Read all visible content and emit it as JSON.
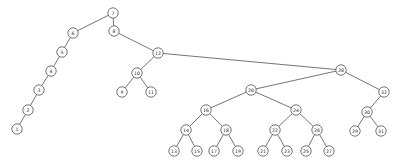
{
  "diagram": {
    "kind": "binary-search-tree",
    "title": "",
    "node_radius": 5.2,
    "colors": {
      "background": "#ffffff",
      "edge": "#3a3a3a",
      "node_fill": "#ffffff",
      "node_stroke": "#3a3a3a",
      "label": "#1a1a1a"
    },
    "root_label": "7",
    "nodes": [
      {
        "id": "n7",
        "label": "7",
        "x": 113,
        "y": 13
      },
      {
        "id": "n6",
        "label": "6",
        "x": 73,
        "y": 33
      },
      {
        "id": "n5",
        "label": "5",
        "x": 62,
        "y": 52
      },
      {
        "id": "n4",
        "label": "4",
        "x": 51,
        "y": 71
      },
      {
        "id": "n3",
        "label": "3",
        "x": 39,
        "y": 90
      },
      {
        "id": "n2",
        "label": "2",
        "x": 28,
        "y": 110
      },
      {
        "id": "n1",
        "label": "1",
        "x": 17,
        "y": 129
      },
      {
        "id": "n8",
        "label": "8",
        "x": 114,
        "y": 31
      },
      {
        "id": "n12",
        "label": "12",
        "x": 158,
        "y": 53
      },
      {
        "id": "n10",
        "label": "10",
        "x": 137,
        "y": 73
      },
      {
        "id": "n9",
        "label": "9",
        "x": 122,
        "y": 92
      },
      {
        "id": "n11",
        "label": "11",
        "x": 151,
        "y": 92
      },
      {
        "id": "n28",
        "label": "28",
        "x": 341,
        "y": 70
      },
      {
        "id": "n20",
        "label": "20",
        "x": 251,
        "y": 90
      },
      {
        "id": "n32",
        "label": "32",
        "x": 384,
        "y": 92
      },
      {
        "id": "n30",
        "label": "30",
        "x": 367,
        "y": 112
      },
      {
        "id": "n29",
        "label": "29",
        "x": 355,
        "y": 131
      },
      {
        "id": "n31",
        "label": "31",
        "x": 381,
        "y": 131
      },
      {
        "id": "n16",
        "label": "16",
        "x": 206,
        "y": 110
      },
      {
        "id": "n24",
        "label": "24",
        "x": 296,
        "y": 110
      },
      {
        "id": "n14",
        "label": "14",
        "x": 186,
        "y": 130
      },
      {
        "id": "n18",
        "label": "18",
        "x": 226,
        "y": 130
      },
      {
        "id": "n22",
        "label": "22",
        "x": 275,
        "y": 130
      },
      {
        "id": "n26",
        "label": "26",
        "x": 317,
        "y": 130
      },
      {
        "id": "n13",
        "label": "13",
        "x": 174,
        "y": 151
      },
      {
        "id": "n15",
        "label": "15",
        "x": 197,
        "y": 151
      },
      {
        "id": "n17",
        "label": "17",
        "x": 214,
        "y": 151
      },
      {
        "id": "n19",
        "label": "19",
        "x": 238,
        "y": 151
      },
      {
        "id": "n21",
        "label": "21",
        "x": 263,
        "y": 151
      },
      {
        "id": "n23",
        "label": "23",
        "x": 287,
        "y": 151
      },
      {
        "id": "n25",
        "label": "25",
        "x": 306,
        "y": 151
      },
      {
        "id": "n27",
        "label": "27",
        "x": 329,
        "y": 151
      }
    ],
    "edges": [
      {
        "from": "n7",
        "to": "n6"
      },
      {
        "from": "n6",
        "to": "n5"
      },
      {
        "from": "n5",
        "to": "n4"
      },
      {
        "from": "n4",
        "to": "n3"
      },
      {
        "from": "n3",
        "to": "n2"
      },
      {
        "from": "n2",
        "to": "n1"
      },
      {
        "from": "n7",
        "to": "n8"
      },
      {
        "from": "n8",
        "to": "n12"
      },
      {
        "from": "n12",
        "to": "n10"
      },
      {
        "from": "n10",
        "to": "n9"
      },
      {
        "from": "n10",
        "to": "n11"
      },
      {
        "from": "n12",
        "to": "n28"
      },
      {
        "from": "n28",
        "to": "n20"
      },
      {
        "from": "n28",
        "to": "n32"
      },
      {
        "from": "n32",
        "to": "n30"
      },
      {
        "from": "n30",
        "to": "n29"
      },
      {
        "from": "n30",
        "to": "n31"
      },
      {
        "from": "n20",
        "to": "n16"
      },
      {
        "from": "n20",
        "to": "n24"
      },
      {
        "from": "n16",
        "to": "n14"
      },
      {
        "from": "n16",
        "to": "n18"
      },
      {
        "from": "n14",
        "to": "n13"
      },
      {
        "from": "n14",
        "to": "n15"
      },
      {
        "from": "n18",
        "to": "n17"
      },
      {
        "from": "n18",
        "to": "n19"
      },
      {
        "from": "n24",
        "to": "n22"
      },
      {
        "from": "n24",
        "to": "n26"
      },
      {
        "from": "n22",
        "to": "n21"
      },
      {
        "from": "n22",
        "to": "n23"
      },
      {
        "from": "n26",
        "to": "n25"
      },
      {
        "from": "n26",
        "to": "n27"
      }
    ]
  }
}
